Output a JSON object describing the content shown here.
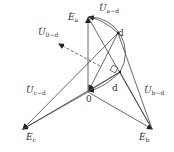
{
  "diagram": {
    "type": "phasor-diagram",
    "labels": {
      "Ea": {
        "base": "E",
        "sub": "a"
      },
      "Eb": {
        "base": "E",
        "sub": "b"
      },
      "Ec": {
        "base": "E",
        "sub": "c"
      },
      "Ua_d": {
        "base": "U",
        "sub": "a−d"
      },
      "Ub_d": {
        "base": "U",
        "sub": "b−d"
      },
      "Uc_d": {
        "base": "U",
        "sub": "c−d"
      },
      "U0_d": {
        "base": "U",
        "sub": "0−d"
      },
      "origin": "0",
      "d_upper": "d",
      "d_lower": "d"
    },
    "points": {
      "O": [
        88,
        92
      ],
      "Ea": [
        88,
        17
      ],
      "Eb": [
        153,
        130
      ],
      "Ec": [
        22,
        130
      ],
      "d_upper": [
        118,
        33
      ],
      "d_lower": [
        120,
        72
      ],
      "U0_tip": [
        58,
        44
      ]
    },
    "stroke_color": "#333333"
  }
}
